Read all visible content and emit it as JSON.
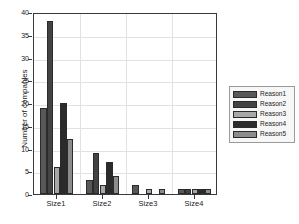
{
  "chart_data": {
    "type": "bar",
    "title": "",
    "xlabel": "",
    "ylabel": "Number of companies",
    "categories": [
      "Size1",
      "Size2",
      "Size3",
      "Size4"
    ],
    "series": [
      {
        "name": "Reason1",
        "color": "#585858",
        "values": [
          19,
          3,
          2,
          1
        ]
      },
      {
        "name": "Reason2",
        "color": "#434343",
        "values": [
          38,
          9,
          0,
          1
        ]
      },
      {
        "name": "Reason3",
        "color": "#a8a8a8",
        "values": [
          6,
          2,
          1,
          1
        ]
      },
      {
        "name": "Reason4",
        "color": "#2b2b2b",
        "values": [
          20,
          7,
          0,
          1
        ]
      },
      {
        "name": "Reason5",
        "color": "#8c8c8c",
        "values": [
          12,
          4,
          1,
          1
        ]
      }
    ],
    "ylim": [
      0,
      40
    ],
    "yticks": [
      0,
      5,
      10,
      15,
      20,
      25,
      30,
      35,
      40
    ],
    "ytick_labels": [
      "0",
      "5",
      "10",
      "15",
      "20",
      "25",
      "30",
      "35",
      "40"
    ],
    "grid": true,
    "legend_position": "right-outside",
    "legend_entries": [
      "Reason1",
      "Reason2",
      "Reason3",
      "Reason4",
      "Reason5"
    ]
  }
}
